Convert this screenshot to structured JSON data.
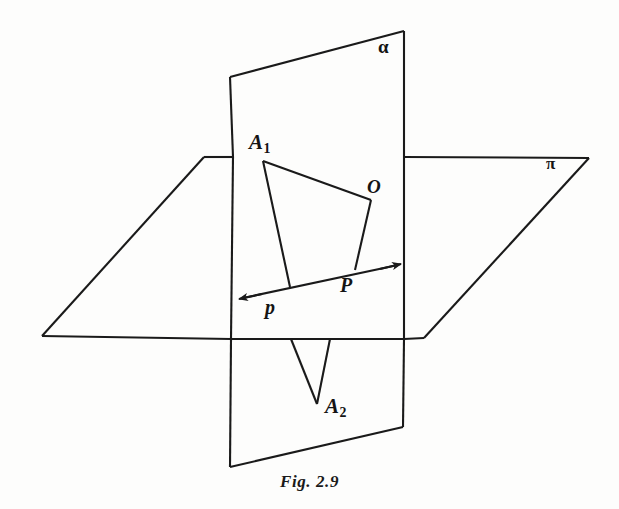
{
  "figure": {
    "caption": "Fig. 2.9",
    "background_color": "#fdfdfc",
    "line_color": "#1a1a1a"
  },
  "labels": {
    "plane_alpha": "α",
    "plane_pi": "π",
    "point_A1_base": "A",
    "point_A1_sub": "1",
    "point_A2_base": "A",
    "point_A2_sub": "2",
    "point_O": "O",
    "point_P": "P",
    "line_p": "p"
  },
  "geometry": {
    "plane_pi": {
      "name": "horizontal plane pi",
      "points": "204,157 589,158 424,338 42,336"
    },
    "plane_alpha_upper": {
      "name": "vertical plane alpha above pi",
      "points": "230,77 404,31 404,157 233,157"
    },
    "plane_alpha_middle": {
      "name": "vertical plane alpha between pi edges",
      "points": "233,157 404,157 404,339 231,339"
    },
    "plane_alpha_lower": {
      "name": "vertical plane alpha below pi",
      "points": "231,339 404,339 403,427 230,467"
    },
    "line_p_start": "404,264",
    "line_p_end": "236,300",
    "triangle_A1": {
      "A1": "263,161",
      "O": "371,200",
      "P": "355,270",
      "foot_on_p": "290,287"
    },
    "lines_to_A2": {
      "from_left": "291,339",
      "from_right": "330,339",
      "A2": "317,404"
    }
  }
}
